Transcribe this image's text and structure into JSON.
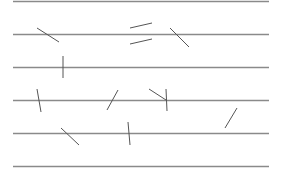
{
  "diagram": {
    "title": "",
    "line_color": "#8a8a8a",
    "needle_color": "#555555",
    "parallel_lines": [
      {
        "y": 1.5,
        "x1": 13,
        "x2": 269
      },
      {
        "y": 34.5,
        "x1": 13,
        "x2": 269
      },
      {
        "y": 67.5,
        "x1": 13,
        "x2": 269
      },
      {
        "y": 100.5,
        "x1": 13,
        "x2": 269
      },
      {
        "y": 133.5,
        "x1": 13,
        "x2": 269
      },
      {
        "y": 166.5,
        "x1": 13,
        "x2": 269
      }
    ],
    "needles": [
      {
        "x1": 37,
        "y1": 28,
        "x2": 59,
        "y2": 42
      },
      {
        "x1": 130,
        "y1": 28,
        "x2": 152,
        "y2": 23
      },
      {
        "x1": 130,
        "y1": 44,
        "x2": 152,
        "y2": 39
      },
      {
        "x1": 170,
        "y1": 28,
        "x2": 189,
        "y2": 47
      },
      {
        "x1": 63,
        "y1": 56,
        "x2": 63,
        "y2": 78
      },
      {
        "x1": 37,
        "y1": 89,
        "x2": 41,
        "y2": 112
      },
      {
        "x1": 107,
        "y1": 110,
        "x2": 118,
        "y2": 90
      },
      {
        "x1": 149,
        "y1": 89,
        "x2": 166,
        "y2": 100
      },
      {
        "x1": 166,
        "y1": 89,
        "x2": 167,
        "y2": 111
      },
      {
        "x1": 61,
        "y1": 128,
        "x2": 79,
        "y2": 145
      },
      {
        "x1": 128,
        "y1": 122,
        "x2": 130,
        "y2": 145
      },
      {
        "x1": 225,
        "y1": 128,
        "x2": 237,
        "y2": 108
      }
    ]
  }
}
